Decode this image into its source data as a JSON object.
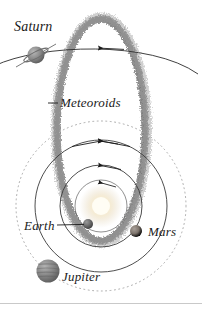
{
  "figure": {
    "type": "astronomy-diagram",
    "background_color": "#ffffff",
    "ink_color": "#1a1a1a"
  },
  "labels": {
    "saturn": "Saturn",
    "meteoroids": "Meteoroids",
    "earth": "Earth",
    "mars": "Mars",
    "jupiter": "Jupiter"
  },
  "bodies": {
    "sun": {
      "name": "Sun",
      "color": "#f0e4c8",
      "glow": "#ffffff"
    },
    "saturn": {
      "name": "Saturn",
      "color": "#8c8c8c",
      "has_ring": true
    },
    "earth": {
      "name": "Earth",
      "color": "#6e6e6e"
    },
    "mars": {
      "name": "Mars",
      "color": "#7a7068"
    },
    "jupiter": {
      "name": "Jupiter",
      "color": "#8a8a8a",
      "has_bands": true
    }
  },
  "orbits": {
    "earth_orbit": {
      "style": "solid",
      "color": "#333333"
    },
    "mars_orbit": {
      "style": "solid",
      "color": "#333333"
    },
    "jupiter_orbit": {
      "style": "dotted",
      "color": "#999999"
    },
    "saturn_orbit": {
      "style": "solid",
      "color": "#333333"
    },
    "meteoroid_stream": {
      "style": "speckled",
      "color": "#9a9a9a"
    }
  },
  "annotations": {
    "direction_arrows": "counterclockwise",
    "arrow_count": 3
  }
}
